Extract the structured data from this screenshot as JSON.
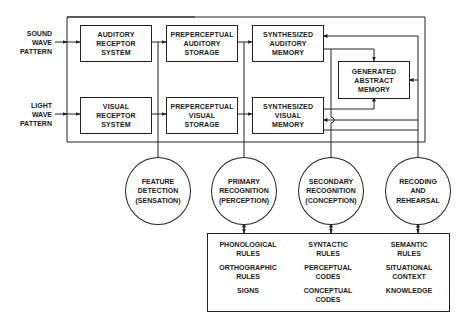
{
  "inputs": {
    "sound": [
      "SOUND",
      "WAVE",
      "PATTERN"
    ],
    "light": [
      "LIGHT",
      "WAVE",
      "PATTERN"
    ]
  },
  "boxes": {
    "auditory_receptor": [
      "AUDITORY",
      "RECEPTOR",
      "SYSTEM"
    ],
    "visual_receptor": [
      "VISUAL",
      "RECEPTOR",
      "SYSTEM"
    ],
    "preperceptual_auditory": [
      "PREPERCEPTUAL",
      "AUDITORY",
      "STORAGE"
    ],
    "preperceptual_visual": [
      "PREPERCEPTUAL",
      "VISUAL",
      "STORAGE"
    ],
    "synthesized_auditory": [
      "SYNTHESIZED",
      "AUDITORY",
      "MEMORY"
    ],
    "synthesized_visual": [
      "SYNTHESIZED",
      "VISUAL",
      "MEMORY"
    ],
    "generated_abstract": [
      "GENERATED",
      "ABSTRACT",
      "MEMORY"
    ]
  },
  "processes": [
    {
      "lines": [
        "FEATURE",
        "DETECTION",
        "(SENSATION)"
      ]
    },
    {
      "lines": [
        "PRIMARY",
        "RECOGNITION",
        "(PERCEPTION)"
      ]
    },
    {
      "lines": [
        "SECONDARY",
        "RECOGNITION",
        "(CONCEPTION)"
      ]
    },
    {
      "lines": [
        "RECODING",
        "AND",
        "REHEARSAL"
      ]
    }
  ],
  "knowledge": {
    "columns": [
      {
        "items": [
          [
            "PHONOLOGICAL",
            "RULES"
          ],
          [
            "ORTHOGRAPHIC",
            "RULES"
          ],
          [
            "SIGNS"
          ]
        ]
      },
      {
        "items": [
          [
            "SYNTACTIC",
            "RULES"
          ],
          [
            "PERCEPTUAL",
            "CODES"
          ],
          [
            "CONCEPTUAL",
            "CODES"
          ]
        ]
      },
      {
        "items": [
          [
            "SEMANTIC",
            "RULES"
          ],
          [
            "SITUATIONAL",
            "CONTEXT"
          ],
          [
            "KNOWLEDGE"
          ]
        ]
      }
    ]
  },
  "colors": {
    "ink": "#222222",
    "background": "#ffffff"
  }
}
